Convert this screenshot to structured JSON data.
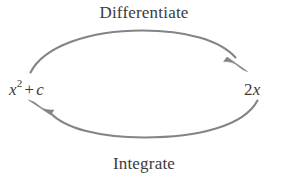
{
  "diagram": {
    "type": "cycle-diagram",
    "title_top": "Differentiate",
    "title_bottom": "Integrate",
    "background_color": "#ffffff",
    "arc_color": "#808080",
    "text_color": "#3b3b3b",
    "nodes": {
      "left": {
        "full_text": "x² + c",
        "base": "x",
        "exponent": "2",
        "operator": "+",
        "constant": "c"
      },
      "right": {
        "full_text": "2x",
        "coefficient": "2",
        "variable": "x"
      }
    },
    "edges": [
      {
        "label": "Differentiate",
        "from": "x² + c",
        "to": "2x",
        "direction": "clockwise-top",
        "arrowhead": "right-end"
      },
      {
        "label": "Integrate",
        "from": "2x",
        "to": "x² + c",
        "direction": "counterclockwise-bottom",
        "arrowhead": "left-end"
      }
    ]
  }
}
